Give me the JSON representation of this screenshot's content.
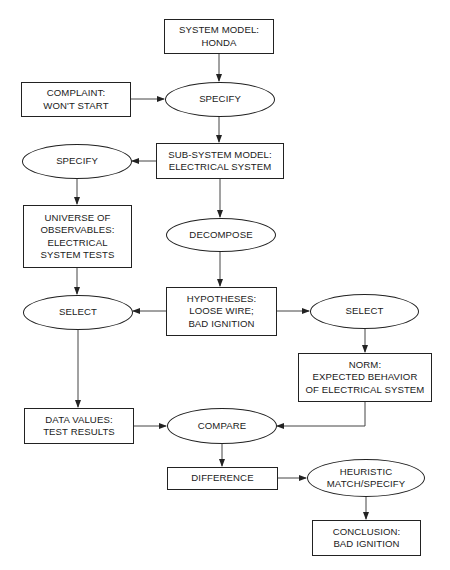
{
  "diagram": {
    "type": "flowchart",
    "title": "",
    "nodes": {
      "system_model": {
        "shape": "rect",
        "lines": [
          "SYSTEM MODEL:",
          "HONDA"
        ]
      },
      "complaint": {
        "shape": "rect",
        "lines": [
          "COMPLAINT:",
          "WON'T START"
        ]
      },
      "specify_1": {
        "shape": "ellipse",
        "lines": [
          "SPECIFY"
        ]
      },
      "subsystem_model": {
        "shape": "rect",
        "lines": [
          "SUB-SYSTEM MODEL:",
          "ELECTRICAL SYSTEM"
        ]
      },
      "specify_2": {
        "shape": "ellipse",
        "lines": [
          "SPECIFY"
        ]
      },
      "universe_observables": {
        "shape": "rect",
        "lines": [
          "UNIVERSE OF",
          "OBSERVABLES:",
          "ELECTRICAL",
          "SYSTEM TESTS"
        ]
      },
      "decompose": {
        "shape": "ellipse",
        "lines": [
          "DECOMPOSE"
        ]
      },
      "select_left": {
        "shape": "ellipse",
        "lines": [
          "SELECT"
        ]
      },
      "hypotheses": {
        "shape": "rect",
        "lines": [
          "HYPOTHESES:",
          "LOOSE WIRE;",
          "BAD IGNITION"
        ]
      },
      "select_right": {
        "shape": "ellipse",
        "lines": [
          "SELECT"
        ]
      },
      "norm": {
        "shape": "rect",
        "lines": [
          "NORM:",
          "EXPECTED BEHAVIOR",
          "OF ELECTRICAL SYSTEM"
        ]
      },
      "data_values": {
        "shape": "rect",
        "lines": [
          "DATA VALUES:",
          "TEST RESULTS"
        ]
      },
      "compare": {
        "shape": "ellipse",
        "lines": [
          "COMPARE"
        ]
      },
      "difference": {
        "shape": "rect",
        "lines": [
          "DIFFERENCE"
        ]
      },
      "heuristic_match": {
        "shape": "ellipse",
        "lines": [
          "HEURISTIC",
          "MATCH/SPECIFY"
        ]
      },
      "conclusion": {
        "shape": "rect",
        "lines": [
          "CONCLUSION:",
          "BAD IGNITION"
        ]
      }
    },
    "edges": [
      {
        "from": "system_model",
        "to": "specify_1"
      },
      {
        "from": "complaint",
        "to": "specify_1"
      },
      {
        "from": "specify_1",
        "to": "subsystem_model"
      },
      {
        "from": "subsystem_model",
        "to": "specify_2"
      },
      {
        "from": "specify_2",
        "to": "universe_observables"
      },
      {
        "from": "subsystem_model",
        "to": "decompose"
      },
      {
        "from": "universe_observables",
        "to": "select_left"
      },
      {
        "from": "decompose",
        "to": "hypotheses"
      },
      {
        "from": "hypotheses",
        "to": "select_left"
      },
      {
        "from": "hypotheses",
        "to": "select_right"
      },
      {
        "from": "select_right",
        "to": "norm"
      },
      {
        "from": "select_left",
        "to": "data_values"
      },
      {
        "from": "data_values",
        "to": "compare"
      },
      {
        "from": "norm",
        "to": "compare"
      },
      {
        "from": "compare",
        "to": "difference"
      },
      {
        "from": "difference",
        "to": "heuristic_match"
      },
      {
        "from": "heuristic_match",
        "to": "conclusion"
      }
    ],
    "colors": {
      "stroke": "#222222",
      "text": "#1a1a1a",
      "background": "#ffffff"
    }
  }
}
